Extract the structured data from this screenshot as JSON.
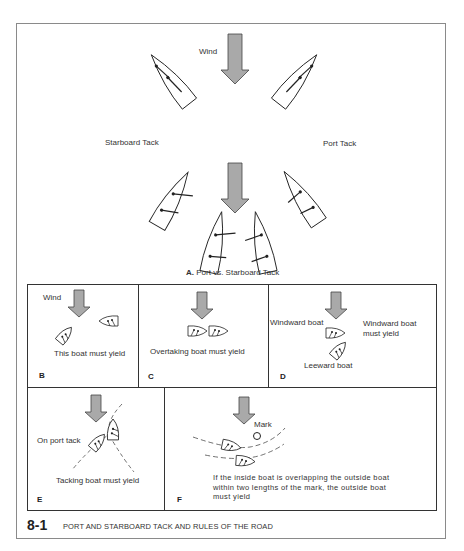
{
  "figure": {
    "number": "8-1",
    "caption": "PORT AND STARBOARD TACK AND RULES OF THE ROAD"
  },
  "panel_a": {
    "letter": "A.",
    "title": "Port vs. Starboard Tack",
    "wind_label": "Wind",
    "left_label": "Starboard Tack",
    "right_label": "Port Tack"
  },
  "panel_b": {
    "letter": "B",
    "wind_label": "Wind",
    "note": "This boat must yield"
  },
  "panel_c": {
    "letter": "C",
    "note": "Overtaking boat must yield"
  },
  "panel_d": {
    "letter": "D",
    "windward_label": "Windward boat",
    "note_line1": "Windward boat",
    "note_line2": "must yield",
    "leeward_label": "Leeward boat"
  },
  "panel_e": {
    "letter": "E",
    "port_label": "On port tack",
    "note": "Tacking boat must yield"
  },
  "panel_f": {
    "letter": "F",
    "mark_label": "Mark",
    "note": "If the inside boat is overlapping the outside boat within two lengths of the mark, the outside boat must yield"
  },
  "colors": {
    "arrow_fill": "#a9a9a9",
    "arrow_stroke": "#444444",
    "line": "#222222",
    "border": "#8a8a8a"
  }
}
